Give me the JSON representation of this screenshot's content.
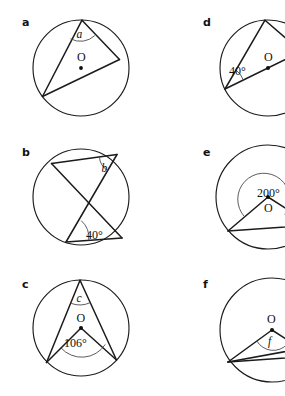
{
  "figure": {
    "panel_count": 6,
    "columns": 2,
    "rows": 3,
    "background_color": "#ffffff",
    "stroke_color": "#1b1b1b",
    "arc_mark_color": "#4a4a4a",
    "center_label": "O"
  },
  "panels": [
    {
      "letter": "a",
      "center_label": "O",
      "angle_label": "a",
      "angle_kind": "inscribed",
      "has_center_dot": true,
      "description": "Circle with centre O, diameter drawn, inscribed angle a at top vertex subtending the diameter"
    },
    {
      "letter": "b",
      "center_label": "",
      "angle_label": "b",
      "given_label": "40°",
      "angle_kind": "inscribed",
      "has_center_dot": false,
      "description": "Circle with two crossing chords, angle b at upper right vertex and 40 degrees at lower vertex in the same segment"
    },
    {
      "letter": "c",
      "center_label": "O",
      "angle_label": "c",
      "given_label": "106°",
      "angle_kind": "inscribed-and-central",
      "has_center_dot": true,
      "description": "Circle with centre O, central angle 106 degrees and inscribed angle c on the same arc"
    },
    {
      "letter": "d",
      "center_label": "O",
      "given_label": "40°",
      "angle_kind": "inscribed",
      "has_center_dot": true,
      "description": "Circle with centre O, diameter drawn, inscribed angle 40 degrees at left vertex"
    },
    {
      "letter": "e",
      "center_label": "O",
      "given_label": "200°",
      "angle_kind": "reflex-central",
      "has_center_dot": true,
      "description": "Circle with centre O, reflex central angle 200 degrees marked at the centre"
    },
    {
      "letter": "f",
      "center_label": "O",
      "angle_label": "f",
      "angle_kind": "central",
      "has_center_dot": true,
      "description": "Circle with centre O, angle f marked at the centre between two radii"
    }
  ]
}
